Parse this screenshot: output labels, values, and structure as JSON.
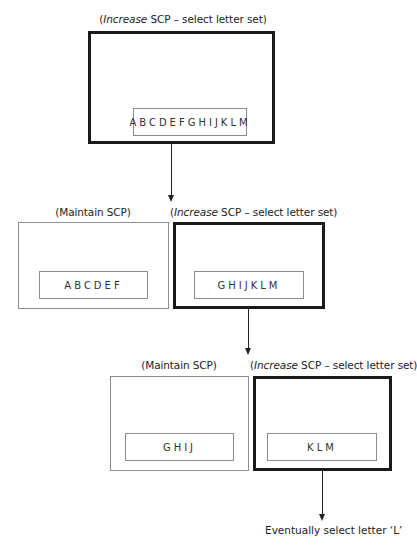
{
  "diagram": {
    "level1": {
      "caption_prefix": "(",
      "caption_italic": "Increase",
      "caption_suffix": " SCP – select letter set)",
      "letters": "ABCDEFGHIJKLM"
    },
    "level2": {
      "left": {
        "caption": "(Maintain SCP)",
        "letters": "ABCDEF"
      },
      "right": {
        "caption_prefix": "(",
        "caption_italic": "Increase",
        "caption_suffix": " SCP – select letter set)",
        "letters": "GHIJKLM"
      }
    },
    "level3": {
      "left": {
        "caption": "(Maintain SCP)",
        "letters": "GHIJ"
      },
      "right": {
        "caption_prefix": "(",
        "caption_italic": "Increase",
        "caption_suffix": " SCP – select letter set)",
        "letters": "KLM"
      }
    },
    "final_note": "Eventually select letter ‘L’"
  }
}
